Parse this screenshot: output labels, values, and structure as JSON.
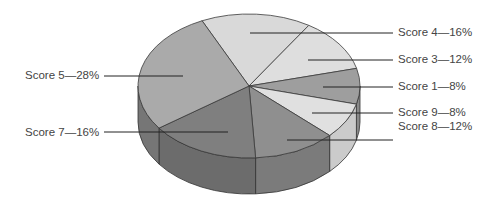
{
  "chart_data": {
    "type": "pie",
    "style": "3d",
    "title": "",
    "unit": "%",
    "slices": [
      {
        "name": "Score 4",
        "value": 16,
        "label": "Score 4—16%",
        "color": "#d9d9d9",
        "side": "#c4c4c4"
      },
      {
        "name": "Score 3",
        "value": 12,
        "label": "Score 3—12%",
        "color": "#dedede",
        "side": "#c8c8c8"
      },
      {
        "name": "Score 1",
        "value": 8,
        "label": "Score 1—8%",
        "color": "#9e9e9e",
        "side": "#8a8a8a"
      },
      {
        "name": "Score 9",
        "value": 8,
        "label": "Score 9—8%",
        "color": "#e0e0e0",
        "side": "#cbcbcb"
      },
      {
        "name": "Score 8",
        "value": 12,
        "label": "Score 8—12%",
        "color": "#8f8f8f",
        "side": "#7b7b7b"
      },
      {
        "name": "Score 7",
        "value": 16,
        "label": "Score 7—16%",
        "color": "#7f7f7f",
        "side": "#6c6c6c"
      },
      {
        "name": "Score 5",
        "value": 28,
        "label": "Score 5—28%",
        "color": "#aaaaaa",
        "side": "#767676"
      }
    ],
    "legend": "none",
    "label_position": "leader-lines"
  }
}
